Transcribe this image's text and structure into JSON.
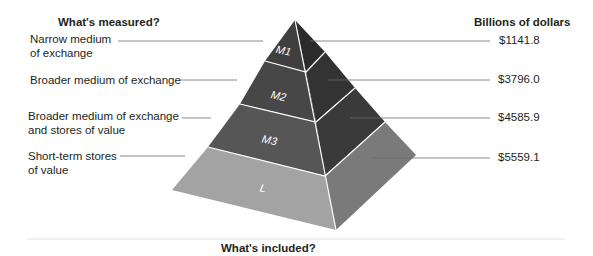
{
  "headers": {
    "left": "What's measured?",
    "right": "Billions of dollars",
    "bottom": "What's included?"
  },
  "layers": [
    {
      "id": "M1",
      "label": "M1",
      "description_line1": "Narrow medium",
      "description_line2": "of exchange",
      "value": "$1141.8"
    },
    {
      "id": "M2",
      "label": "M2",
      "description_line1": "Broader medium of exchange",
      "description_line2": "",
      "value": "$3796.0"
    },
    {
      "id": "M3",
      "label": "M3",
      "description_line1": "Broader medium of exchange",
      "description_line2": "and stores of value",
      "value": "$4585.9"
    },
    {
      "id": "L",
      "label": "L",
      "description_line1": "Short-term stores",
      "description_line2": "of value",
      "value": "$5559.1"
    }
  ],
  "colors": {
    "M1_front": "#3f3f3f",
    "M1_side": "#2b2b2b",
    "M2_front": "#474747",
    "M2_side": "#333333",
    "M3_front": "#565656",
    "M3_side": "#3a3a3a",
    "L_front": "#a3a3a3",
    "L_side": "#7a7a7a",
    "leader": "#6d6d6d"
  }
}
